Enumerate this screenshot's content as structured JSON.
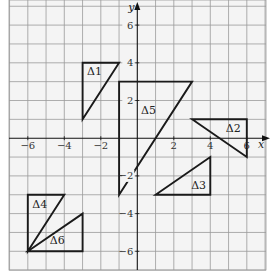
{
  "diagram": {
    "type": "coordinate-grid",
    "x_axis": {
      "label": "x",
      "min": -7,
      "max": 7,
      "ticks": [
        -6,
        -4,
        -2,
        2,
        4,
        6
      ],
      "tick_labels": [
        "−6",
        "−4",
        "−2",
        "2",
        "4",
        "6"
      ]
    },
    "y_axis": {
      "label": "y",
      "min": -7,
      "max": 7.3,
      "ticks": [
        6,
        4,
        2,
        -2,
        -4,
        -6
      ],
      "tick_labels": [
        "6",
        "4",
        "2",
        "−2",
        "−4",
        "−6"
      ]
    },
    "grid": {
      "step": 1,
      "color": "#9a9a9a"
    },
    "background": "#f4f4f4",
    "triangles": [
      {
        "id": "t1",
        "label": "Δ1",
        "vertices": [
          [
            -3,
            4
          ],
          [
            -1,
            4
          ],
          [
            -3,
            1
          ]
        ],
        "label_pos": [
          -2.75,
          3.35
        ]
      },
      {
        "id": "t2",
        "label": "Δ2",
        "vertices": [
          [
            3,
            1
          ],
          [
            6,
            1
          ],
          [
            6,
            -1
          ]
        ],
        "label_pos": [
          4.85,
          0.35
        ]
      },
      {
        "id": "t3",
        "label": "Δ3",
        "vertices": [
          [
            1,
            -3
          ],
          [
            4,
            -3
          ],
          [
            4,
            -1
          ]
        ],
        "label_pos": [
          2.95,
          -2.7
        ]
      },
      {
        "id": "t4",
        "label": "Δ4",
        "vertices": [
          [
            -6,
            -3
          ],
          [
            -4,
            -3
          ],
          [
            -6,
            -6
          ]
        ],
        "label_pos": [
          -5.75,
          -3.7
        ]
      },
      {
        "id": "t5",
        "label": "Δ5",
        "vertices": [
          [
            -1,
            3
          ],
          [
            3,
            3
          ],
          [
            -1,
            -3
          ]
        ],
        "label_pos": [
          0.2,
          1.3
        ]
      },
      {
        "id": "t6",
        "label": "Δ6",
        "vertices": [
          [
            -6,
            -6
          ],
          [
            -3,
            -6
          ],
          [
            -3,
            -4
          ]
        ],
        "label_pos": [
          -4.8,
          -5.6
        ]
      }
    ]
  }
}
